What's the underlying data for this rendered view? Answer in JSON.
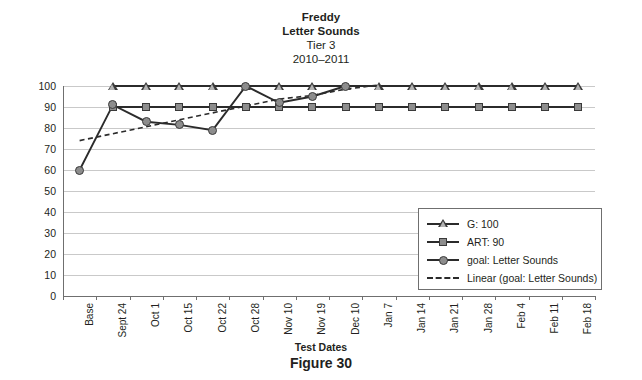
{
  "title": {
    "line1": "Freddy",
    "line2": "Letter Sounds",
    "line3": "Tier 3",
    "line4": "2010–2011"
  },
  "caption": "Figure 30",
  "legend": {
    "items": [
      {
        "label": "G: 100",
        "marker": "triangle-icon",
        "style": "solid"
      },
      {
        "label": "ART: 90",
        "marker": "square-icon",
        "style": "solid"
      },
      {
        "label": "goal: Letter Sounds",
        "marker": "circle-icon",
        "style": "solid"
      },
      {
        "label": "Linear (goal: Letter Sounds)",
        "marker": "none",
        "style": "dashed"
      }
    ]
  },
  "chart_data": {
    "type": "line",
    "title": "Freddy Letter Sounds Tier 3 2010–2011",
    "xlabel": "Test Dates",
    "ylabel": "",
    "ylim": [
      0,
      100
    ],
    "ytick_step": 10,
    "yticks": [
      0,
      10,
      20,
      30,
      40,
      50,
      60,
      70,
      80,
      90,
      100
    ],
    "grid": true,
    "legend_position": "inside-lower-right",
    "categories": [
      "Base",
      "Sept 24",
      "Oct 1",
      "Oct 15",
      "Oct 22",
      "Oct 28",
      "Nov 10",
      "Nov 19",
      "Dec 10",
      "Jan 7",
      "Jan 14",
      "Jan 21",
      "Jan 28",
      "Feb 4",
      "Feb 11",
      "Feb 18"
    ],
    "series": [
      {
        "name": "G: 100",
        "marker": "triangle",
        "style": "solid",
        "values": [
          null,
          100,
          100,
          100,
          100,
          100,
          100,
          100,
          100,
          100,
          100,
          100,
          100,
          100,
          100,
          100
        ]
      },
      {
        "name": "ART: 90",
        "marker": "square",
        "style": "solid",
        "values": [
          null,
          90,
          90,
          90,
          90,
          90,
          90,
          90,
          90,
          90,
          90,
          90,
          90,
          90,
          90,
          90
        ]
      },
      {
        "name": "goal: Letter Sounds",
        "marker": "circle",
        "style": "solid",
        "values": [
          60,
          91,
          83,
          81.5,
          79,
          100,
          92,
          95,
          100,
          null,
          null,
          null,
          null,
          null,
          null,
          null
        ]
      },
      {
        "name": "Linear (goal: Letter Sounds)",
        "marker": "none",
        "style": "dashed",
        "trend_from": {
          "category": "Base",
          "value": 74
        },
        "trend_to": {
          "category": "Jan 7",
          "value": 100.5
        },
        "values": [
          74,
          77.3,
          80.6,
          83.9,
          87.2,
          90.5,
          93.8,
          95.5,
          98.5,
          100.5,
          null,
          null,
          null,
          null,
          null,
          null
        ]
      }
    ]
  }
}
